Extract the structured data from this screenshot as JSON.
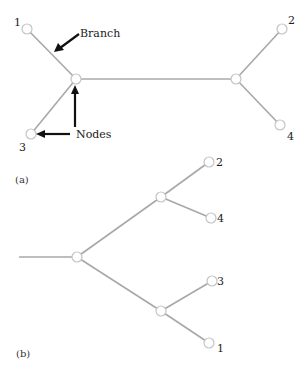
{
  "figure": {
    "panel_a": {
      "caption": "(a)",
      "annotations": {
        "branch": "Branch",
        "nodes": "Nodes"
      },
      "tips": [
        {
          "label": "1",
          "x": 27,
          "y": 29
        },
        {
          "label": "2",
          "x": 282,
          "y": 29
        },
        {
          "label": "3",
          "x": 31,
          "y": 134
        },
        {
          "label": "4",
          "x": 280,
          "y": 125
        }
      ],
      "internal": [
        {
          "x": 76,
          "y": 79
        },
        {
          "x": 236,
          "y": 79
        }
      ]
    },
    "panel_b": {
      "caption": "(b)",
      "root": {
        "x": 77,
        "y": 257,
        "stem_x": 19
      },
      "internal": [
        {
          "x": 161,
          "y": 197
        },
        {
          "x": 161,
          "y": 311
        }
      ],
      "tips": [
        {
          "label": "2",
          "x": 209,
          "y": 162
        },
        {
          "label": "4",
          "x": 211,
          "y": 218
        },
        {
          "label": "3",
          "x": 212,
          "y": 281
        },
        {
          "label": "1",
          "x": 209,
          "y": 343
        }
      ]
    },
    "colors": {
      "branch": "#a8a8a8",
      "node_stroke": "#c4c4c4",
      "arrow": "#111111"
    }
  }
}
